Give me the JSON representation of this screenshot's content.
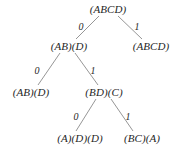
{
  "figure": {
    "background_color": "#ffffff",
    "text_color": "#262626",
    "edge_color": "#8a8a8a",
    "width": 179,
    "height": 153
  },
  "tree": {
    "levels": [
      {
        "index": 0,
        "y": 9,
        "nodes": [
          {
            "id": "root",
            "label": "(ABCD)",
            "x": 108
          }
        ]
      },
      {
        "index": 1,
        "y": 46,
        "nodes": [
          {
            "id": "n-0",
            "label": "(AB)(D)",
            "x": 69
          },
          {
            "id": "n-1",
            "label": "(ABCD)",
            "x": 151
          }
        ]
      },
      {
        "index": 2,
        "y": 92,
        "nodes": [
          {
            "id": "n-00",
            "label": "(AB)(D)",
            "x": 31
          },
          {
            "id": "n-01",
            "label": "(BD)(C)",
            "x": 104
          }
        ]
      },
      {
        "index": 3,
        "y": 138,
        "nodes": [
          {
            "id": "n-010",
            "label": "(A)(D)(D)",
            "x": 80
          },
          {
            "id": "n-011",
            "label": "(BC)(A)",
            "x": 142
          }
        ]
      }
    ],
    "edges": [
      {
        "id": "edge-root-0",
        "from": "root",
        "to": "n-0",
        "label": "0",
        "x1": 99,
        "y1": 16,
        "x2": 76,
        "y2": 39,
        "label_x": 81,
        "label_y": 26
      },
      {
        "id": "edge-root-1",
        "from": "root",
        "to": "n-1",
        "label": "1",
        "x1": 118,
        "y1": 16,
        "x2": 142,
        "y2": 39,
        "label_x": 137,
        "label_y": 26
      },
      {
        "id": "edge-0-00",
        "from": "n-0",
        "to": "n-00",
        "label": "0",
        "x1": 60,
        "y1": 53,
        "x2": 38,
        "y2": 85,
        "label_x": 37,
        "label_y": 70
      },
      {
        "id": "edge-0-01",
        "from": "n-0",
        "to": "n-01",
        "label": "1",
        "x1": 75,
        "y1": 53,
        "x2": 98,
        "y2": 85,
        "label_x": 93,
        "label_y": 70
      },
      {
        "id": "edge-01-010",
        "from": "n-01",
        "to": "n-010",
        "label": "0",
        "x1": 96,
        "y1": 99,
        "x2": 76,
        "y2": 131,
        "label_x": 76,
        "label_y": 116
      },
      {
        "id": "edge-01-011",
        "from": "n-01",
        "to": "n-011",
        "label": "1",
        "x1": 111,
        "y1": 99,
        "x2": 133,
        "y2": 131,
        "label_x": 128,
        "label_y": 116
      }
    ]
  }
}
